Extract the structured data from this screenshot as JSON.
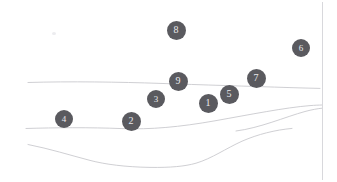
{
  "figure": {
    "width": 337,
    "height": 182,
    "background_color": "#ffffff",
    "line_color": "#c9c9ce",
    "marker_fill_color": "#5a5a5f",
    "marker_text_color": "#e9e9ec",
    "border_color": "#d8d8dc"
  },
  "markers": [
    {
      "id": "marker-8",
      "label": "8",
      "x": 176,
      "y": 30,
      "r": 9.5,
      "font_size": 10
    },
    {
      "id": "marker-6",
      "label": "6",
      "x": 301,
      "y": 48,
      "r": 9.0,
      "font_size": 9
    },
    {
      "id": "marker-9",
      "label": "9",
      "x": 178,
      "y": 81,
      "r": 9.5,
      "font_size": 10
    },
    {
      "id": "marker-7",
      "label": "7",
      "x": 256,
      "y": 78,
      "r": 9.5,
      "font_size": 10
    },
    {
      "id": "marker-3",
      "label": "3",
      "x": 156,
      "y": 99,
      "r": 9.0,
      "font_size": 9
    },
    {
      "id": "marker-5",
      "label": "5",
      "x": 229,
      "y": 94,
      "r": 9.5,
      "font_size": 10
    },
    {
      "id": "marker-1",
      "label": "1",
      "x": 208,
      "y": 103,
      "r": 9.5,
      "font_size": 10
    },
    {
      "id": "marker-4",
      "label": "4",
      "x": 64,
      "y": 119,
      "r": 9.0,
      "font_size": 9
    },
    {
      "id": "marker-2",
      "label": "2",
      "x": 131,
      "y": 121,
      "r": 9.5,
      "font_size": 10
    }
  ],
  "contours": [
    {
      "id": "contour-upper",
      "name": "upper-contour-line",
      "path": "M 28 82.5 C 70 81.2, 120 82.0, 160 83.4 C 200 84.8, 250 86.3, 290 87.6 C 300 87.9, 310 88.2, 320 88.4"
    },
    {
      "id": "contour-middle",
      "name": "middle-contour-line",
      "path": "M 26 128.5 C 55 127.6, 90 127.3, 122 128.6 C 150 129.7, 180 127.0, 215 120.8 C 250 114.6, 285 107.6, 310 105.6 C 315 105.2, 319 105.1, 322 105.0"
    },
    {
      "id": "contour-middle-branch",
      "name": "middle-contour-branch-line",
      "path": "M 236 131.0 C 260 128.0, 285 117.0, 305 111.5 C 312 109.6, 318 108.6, 322 108.2"
    },
    {
      "id": "contour-lower",
      "name": "lower-contour-line",
      "path": "M 28 144.5 C 50 148.8, 70 155.2, 90 160.4 C 105 164.3, 125 167.0, 150 167.4 C 170 167.7, 185 166.4, 196 163.2 C 212 158.4, 226 148.4, 242 141.2 C 258 134.2, 275 130.0, 292 128.4"
    }
  ],
  "smudges": [
    {
      "id": "smudge-top-left",
      "x": 52,
      "y": 32,
      "w": 4,
      "h": 3
    }
  ],
  "border": {
    "right_rule": {
      "x": 322,
      "y": 2,
      "w": 1,
      "h": 178
    }
  }
}
